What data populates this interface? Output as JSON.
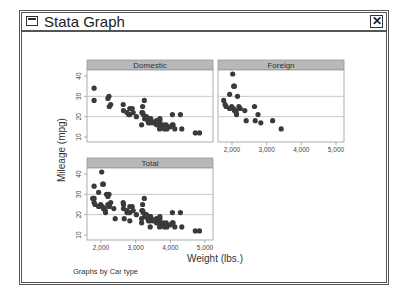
{
  "window": {
    "title": "Stata Graph",
    "close_label": "✕",
    "icon": "window-menu-icon"
  },
  "colors": {
    "header_fill": "#b8b8b8",
    "marker": "#3a3a3a",
    "grid": "#c8c8c8",
    "axis": "#9a9a9a",
    "text": "#444444"
  },
  "chart_data": {
    "type": "scatter",
    "title": "",
    "xlabel": "Weight (lbs.)",
    "ylabel": "Mileage (mpg)",
    "note": "Graphs by Car type",
    "xticks": [
      "2,000",
      "3,000",
      "4,000",
      "5,000"
    ],
    "xtick_values": [
      2000,
      3000,
      4000,
      5000
    ],
    "yticks": [
      "10",
      "20",
      "30",
      "40"
    ],
    "ytick_values": [
      10,
      20,
      30,
      40
    ],
    "grid": true,
    "panels": [
      {
        "name": "Domestic",
        "points": [
          [
            1800,
            34
          ],
          [
            1800,
            28
          ],
          [
            2230,
            30
          ],
          [
            2200,
            29
          ],
          [
            2280,
            26
          ],
          [
            2240,
            25
          ],
          [
            2640,
            26
          ],
          [
            2750,
            22
          ],
          [
            2650,
            23
          ],
          [
            2830,
            24
          ],
          [
            2930,
            22
          ],
          [
            2800,
            21
          ],
          [
            2900,
            24
          ],
          [
            3020,
            20
          ],
          [
            3200,
            22
          ],
          [
            3250,
            28
          ],
          [
            3180,
            22
          ],
          [
            3260,
            19
          ],
          [
            3310,
            20
          ],
          [
            3350,
            18
          ],
          [
            3370,
            17
          ],
          [
            3420,
            19
          ],
          [
            3450,
            18
          ],
          [
            3500,
            17
          ],
          [
            3600,
            16
          ],
          [
            3670,
            17
          ],
          [
            3690,
            16
          ],
          [
            3700,
            18
          ],
          [
            3740,
            15
          ],
          [
            3800,
            16
          ],
          [
            3830,
            14
          ],
          [
            3880,
            15
          ],
          [
            3900,
            14
          ],
          [
            4000,
            15
          ],
          [
            4060,
            21
          ],
          [
            4080,
            16
          ],
          [
            4130,
            14
          ],
          [
            4290,
            21
          ],
          [
            4330,
            14
          ],
          [
            4720,
            12
          ],
          [
            4840,
            12
          ],
          [
            3430,
            19
          ],
          [
            3600,
            18
          ],
          [
            3700,
            19
          ],
          [
            3220,
            21
          ],
          [
            2830,
            21
          ],
          [
            3200,
            25
          ],
          [
            3170,
            16
          ],
          [
            3880,
            16
          ],
          [
            4060,
            16
          ],
          [
            3690,
            14
          ],
          [
            3420,
            17
          ]
        ]
      },
      {
        "name": "Foreign",
        "points": [
          [
            2020,
            41
          ],
          [
            2050,
            35
          ],
          [
            2070,
            35
          ],
          [
            1930,
            31
          ],
          [
            2160,
            30
          ],
          [
            1760,
            28
          ],
          [
            1800,
            26
          ],
          [
            1830,
            25
          ],
          [
            1990,
            25
          ],
          [
            1930,
            24
          ],
          [
            2040,
            24
          ],
          [
            2070,
            23
          ],
          [
            2130,
            21
          ],
          [
            2110,
            23
          ],
          [
            2200,
            25
          ],
          [
            2240,
            24
          ],
          [
            2410,
            18
          ],
          [
            2370,
            23
          ],
          [
            2650,
            25
          ],
          [
            2670,
            18
          ],
          [
            2750,
            21
          ],
          [
            2830,
            17
          ],
          [
            3170,
            18
          ],
          [
            3420,
            14
          ],
          [
            2120,
            22
          ]
        ]
      },
      {
        "name": "Total",
        "points": "Domestic + Foreign combined"
      }
    ]
  }
}
